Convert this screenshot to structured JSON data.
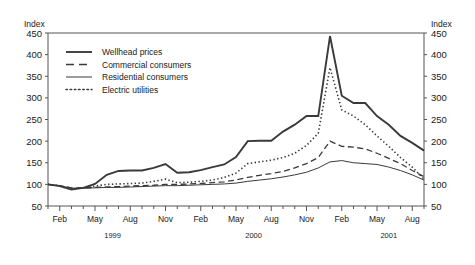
{
  "chart_data": {
    "type": "line",
    "title": "",
    "xlabel": "",
    "ylabel": "Index",
    "ylabel_right": "Index",
    "ylim": [
      50,
      450
    ],
    "ytick_step": 50,
    "yticks": [
      50,
      100,
      150,
      200,
      250,
      300,
      350,
      400,
      450
    ],
    "grid": false,
    "legend_position": "top-left inside plot",
    "x": [
      "Jan 1999",
      "Feb 1999",
      "Mar 1999",
      "Apr 1999",
      "May 1999",
      "Jun 1999",
      "Jul 1999",
      "Aug 1999",
      "Sep 1999",
      "Oct 1999",
      "Nov 1999",
      "Dec 1999",
      "Jan 2000",
      "Feb 2000",
      "Mar 2000",
      "Apr 2000",
      "May 2000",
      "Jun 2000",
      "Jul 2000",
      "Aug 2000",
      "Sep 2000",
      "Oct 2000",
      "Nov 2000",
      "Dec 2000",
      "Jan 2001",
      "Feb 2001",
      "Mar 2001",
      "Apr 2001",
      "May 2001",
      "Jun 2001",
      "Jul 2001",
      "Aug 2001",
      "Sep 2001"
    ],
    "xtick_labels": [
      {
        "index": 1,
        "label": "Feb"
      },
      {
        "index": 4,
        "label": "May"
      },
      {
        "index": 7,
        "label": "Aug"
      },
      {
        "index": 10,
        "label": "Nov"
      },
      {
        "index": 13,
        "label": "Feb"
      },
      {
        "index": 16,
        "label": "May"
      },
      {
        "index": 19,
        "label": "Aug"
      },
      {
        "index": 22,
        "label": "Nov"
      },
      {
        "index": 25,
        "label": "Feb"
      },
      {
        "index": 28,
        "label": "May"
      },
      {
        "index": 31,
        "label": "Aug"
      }
    ],
    "year_labels": [
      {
        "label": "1999",
        "center_index": 5.5
      },
      {
        "label": "2000",
        "center_index": 17.5
      },
      {
        "label": "2001",
        "center_index": 29.0
      }
    ],
    "series": [
      {
        "name": "Wellhead prices",
        "style": "solid-thick",
        "color": "#3a3a3a",
        "values": [
          100,
          96,
          88,
          92,
          101,
          122,
          131,
          132,
          132,
          138,
          147,
          127,
          128,
          133,
          140,
          146,
          163,
          200,
          201,
          201,
          222,
          238,
          258,
          258,
          443,
          305,
          288,
          288,
          258,
          238,
          212,
          196,
          178
        ]
      },
      {
        "name": "Commercial consumers",
        "style": "dashed",
        "color": "#3a3a3a",
        "values": [
          100,
          97,
          92,
          92,
          93,
          94,
          95,
          96,
          97,
          98,
          100,
          100,
          101,
          102,
          104,
          106,
          110,
          116,
          121,
          125,
          130,
          138,
          148,
          162,
          200,
          188,
          186,
          182,
          172,
          160,
          148,
          132,
          118
        ]
      },
      {
        "name": "Residential consumers",
        "style": "solid-thin",
        "color": "#3a3a3a",
        "values": [
          100,
          97,
          91,
          91,
          92,
          93,
          93,
          94,
          95,
          96,
          97,
          97,
          98,
          99,
          100,
          101,
          103,
          107,
          110,
          113,
          117,
          122,
          128,
          138,
          152,
          155,
          150,
          148,
          146,
          140,
          132,
          122,
          110
        ]
      },
      {
        "name": "Electric utilities",
        "style": "dotted",
        "color": "#3a3a3a",
        "values": [
          100,
          97,
          90,
          92,
          96,
          100,
          101,
          102,
          103,
          107,
          112,
          104,
          105,
          107,
          110,
          116,
          126,
          148,
          152,
          156,
          162,
          172,
          190,
          218,
          370,
          272,
          258,
          238,
          212,
          188,
          162,
          140,
          112
        ]
      }
    ]
  },
  "legend": {
    "items": [
      {
        "label": "Wellhead prices",
        "style": "solid-thick"
      },
      {
        "label": "Commercial consumers",
        "style": "dashed"
      },
      {
        "label": "Residential consumers",
        "style": "solid-thin"
      },
      {
        "label": "Electric utilities",
        "style": "dotted"
      }
    ]
  }
}
